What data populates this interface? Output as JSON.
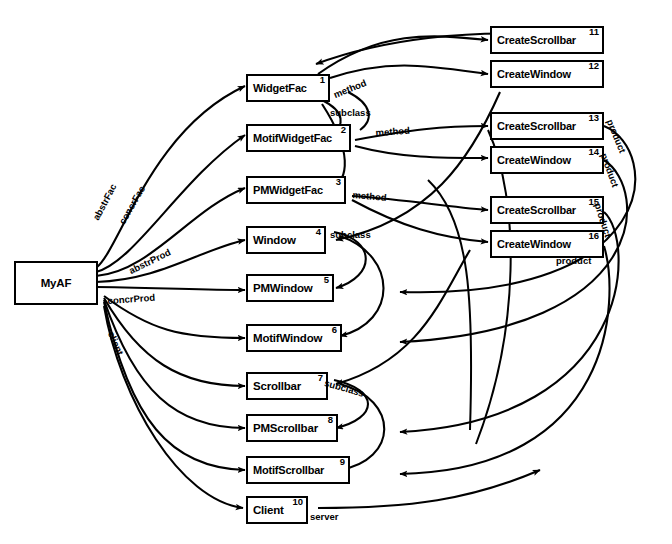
{
  "diagram": {
    "type": "object-graph",
    "root": {
      "label": "MyAF"
    },
    "nodes": [
      {
        "id": 1,
        "label": "WidgetFac"
      },
      {
        "id": 2,
        "label": "MotifWidgetFac"
      },
      {
        "id": 3,
        "label": "PMWidgetFac"
      },
      {
        "id": 4,
        "label": "Window"
      },
      {
        "id": 5,
        "label": "PMWindow"
      },
      {
        "id": 6,
        "label": "MotifWindow"
      },
      {
        "id": 7,
        "label": "Scrollbar"
      },
      {
        "id": 8,
        "label": "PMScrollbar"
      },
      {
        "id": 9,
        "label": "MotifScrollbar"
      },
      {
        "id": 10,
        "label": "Client"
      },
      {
        "id": 11,
        "label": "CreateScrollbar"
      },
      {
        "id": 12,
        "label": "CreateWindow"
      },
      {
        "id": 13,
        "label": "CreateScrollbar"
      },
      {
        "id": 14,
        "label": "CreateWindow"
      },
      {
        "id": 15,
        "label": "CreateScrollbar"
      },
      {
        "id": 16,
        "label": "CreateWindow"
      }
    ],
    "edge_labels": [
      {
        "name": "abstrFac",
        "text": "abstrFac"
      },
      {
        "name": "concrFac",
        "text": "concrFac"
      },
      {
        "name": "abstrProd",
        "text": "abstrProd"
      },
      {
        "name": "concrProd",
        "text": "concrProd"
      },
      {
        "name": "client",
        "text": "client"
      },
      {
        "name": "method-1",
        "text": "method"
      },
      {
        "name": "method-2",
        "text": "method"
      },
      {
        "name": "method-3",
        "text": "method"
      },
      {
        "name": "subclass-1",
        "text": "subclass"
      },
      {
        "name": "subclass-2",
        "text": "subclass"
      },
      {
        "name": "subclass-3",
        "text": "subclass"
      },
      {
        "name": "product-1",
        "text": "product"
      },
      {
        "name": "product-2",
        "text": "product"
      },
      {
        "name": "product-3",
        "text": "product"
      },
      {
        "name": "product-4",
        "text": "product"
      },
      {
        "name": "server",
        "text": "server"
      }
    ],
    "colors": {
      "stroke": "#000000",
      "fill": "#ffffff"
    }
  }
}
